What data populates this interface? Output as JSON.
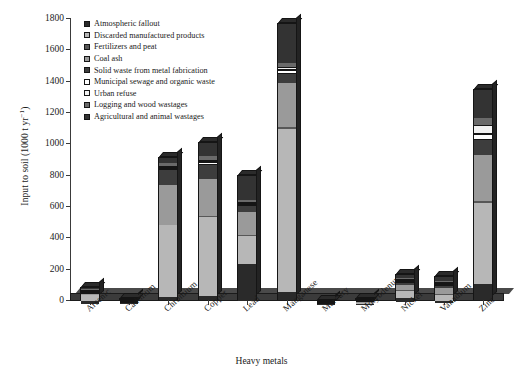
{
  "chart_data": {
    "type": "bar",
    "stacked": true,
    "title": "",
    "xlabel": "Heavy metals",
    "ylabel": "Input to soil (1000 t yr⁻¹)",
    "ylabel_main": "Input to soil (1000 t yr",
    "ylabel_sup": "−1",
    "ylabel_close": ")",
    "ylim": [
      0,
      1800
    ],
    "yticks": [
      0,
      200,
      400,
      600,
      800,
      1000,
      1200,
      1400,
      1600,
      1800
    ],
    "grid": false,
    "legend_position": "upper-left-inside",
    "categories": [
      "Arsenic",
      "Cadmium",
      "Chromium",
      "Copper",
      "Lead",
      "Manganese",
      "Mercury",
      "Molybdenum",
      "Nickel",
      "Vanadium",
      "Zinc"
    ],
    "series": [
      {
        "name": "Atmospheric fallout",
        "color": "#2a2a2a",
        "values": [
          14,
          4,
          22,
          28,
          232,
          48,
          1.5,
          1.5,
          24,
          12,
          100
        ]
      },
      {
        "name": "Discarded manufactured products",
        "color": "#b7b7b7",
        "values": [
          40,
          1.2,
          458,
          500,
          182,
          1040,
          0.3,
          4,
          49,
          40,
          518
        ]
      },
      {
        "name": "Fertilizers and peat",
        "color": "#575757",
        "values": [
          1.5,
          0.3,
          2,
          6,
          4,
          15,
          0.05,
          0.4,
          3,
          3,
          12
        ]
      },
      {
        "name": "Coal ash",
        "color": "#9a9a9a",
        "values": [
          6,
          0.8,
          255,
          235,
          144,
          280,
          0.3,
          4,
          36,
          42,
          298
        ]
      },
      {
        "name": "Solid waste from metal fabrication",
        "color": "#3d3d3d",
        "values": [
          1,
          0.2,
          94,
          92,
          41,
          60,
          0.15,
          1,
          14,
          12,
          92
        ]
      },
      {
        "name": "Municipal sewage and organic waste",
        "color": "#ffffff",
        "values": [
          1.5,
          0.5,
          14,
          18,
          12,
          24,
          0.1,
          0.6,
          6,
          4,
          42
        ]
      },
      {
        "name": "Urban refuse",
        "color": "#f2f2f2",
        "values": [
          1,
          0.4,
          12,
          16,
          10,
          20,
          0.08,
          0.5,
          5,
          3,
          58
        ]
      },
      {
        "name": "Logging and wood wastages",
        "color": "#6a6a6a",
        "values": [
          2,
          0.6,
          18,
          22,
          14,
          28,
          0.1,
          0.8,
          6,
          4,
          40
        ]
      },
      {
        "name": "Agricultural and animal wastages",
        "color": "#333333",
        "values": [
          15,
          2,
          40,
          92,
          160,
          250,
          0.5,
          2,
          22,
          35,
          190
        ]
      }
    ],
    "totals": [
      82,
      10,
      915,
      1009,
      799,
      1765,
      3,
      15,
      165,
      155,
      1350
    ]
  },
  "legend": {
    "items": [
      "Atmospheric fallout",
      "Discarded manufactured products",
      "Fertilizers and peat",
      "Coal ash",
      "Solid waste from metal fabrication",
      "Municipal sewage and organic waste",
      "Urban refuse",
      "Logging and wood wastages",
      "Agricultural and animal wastages"
    ]
  }
}
